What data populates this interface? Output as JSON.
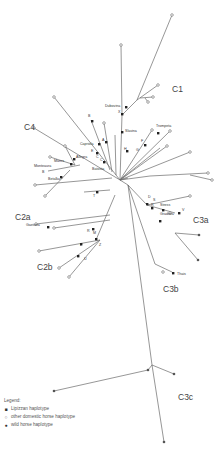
{
  "diagram": {
    "type": "median-joining haplotype network",
    "clades": [
      {
        "id": "C1",
        "x": 172,
        "y": 92
      },
      {
        "id": "C4",
        "x": 24,
        "y": 130
      },
      {
        "id": "C2a",
        "x": 15,
        "y": 220
      },
      {
        "id": "C2b",
        "x": 37,
        "y": 270
      },
      {
        "id": "C3a",
        "x": 193,
        "y": 223
      },
      {
        "id": "C3b",
        "x": 163,
        "y": 292
      },
      {
        "id": "C3c",
        "x": 178,
        "y": 400
      }
    ],
    "node_labels": [
      {
        "text": "Dubovina",
        "x": 105,
        "y": 107
      },
      {
        "text": "X",
        "x": 118,
        "y": 113
      },
      {
        "text": "Slavina",
        "x": 125,
        "y": 132
      },
      {
        "text": "Trompeta",
        "x": 156,
        "y": 127
      },
      {
        "text": "B",
        "x": 88,
        "y": 117
      },
      {
        "text": "Capriola",
        "x": 80,
        "y": 145
      },
      {
        "text": "A",
        "x": 102,
        "y": 141
      },
      {
        "text": "E",
        "x": 91,
        "y": 152
      },
      {
        "text": "C",
        "x": 96,
        "y": 158
      },
      {
        "text": "C",
        "x": 100,
        "y": 161
      },
      {
        "text": "Batosta",
        "x": 92,
        "y": 170
      },
      {
        "text": "H",
        "x": 124,
        "y": 150
      },
      {
        "text": "F",
        "x": 141,
        "y": 142
      },
      {
        "text": "G",
        "x": 136,
        "y": 151
      },
      {
        "text": "Allegra",
        "x": 76,
        "y": 158
      },
      {
        "text": "Manrs",
        "x": 54,
        "y": 162
      },
      {
        "text": "Monteaura",
        "x": 34,
        "y": 167
      },
      {
        "text": "B",
        "x": 42,
        "y": 173
      },
      {
        "text": "Betalka",
        "x": 48,
        "y": 180
      },
      {
        "text": "T",
        "x": 93,
        "y": 197
      },
      {
        "text": "Gaetana",
        "x": 26,
        "y": 226
      },
      {
        "text": "R",
        "x": 87,
        "y": 232
      },
      {
        "text": "M",
        "x": 93,
        "y": 234
      },
      {
        "text": "L",
        "x": 80,
        "y": 246
      },
      {
        "text": "Z",
        "x": 99,
        "y": 246
      },
      {
        "text": "U",
        "x": 84,
        "y": 260
      },
      {
        "text": "D",
        "x": 148,
        "y": 198
      },
      {
        "text": "S",
        "x": 153,
        "y": 201
      },
      {
        "text": "R",
        "x": 151,
        "y": 206
      },
      {
        "text": "Stress",
        "x": 160,
        "y": 206
      },
      {
        "text": "V",
        "x": 182,
        "y": 211
      },
      {
        "text": "Gradova",
        "x": 160,
        "y": 215
      },
      {
        "text": "Thais",
        "x": 177,
        "y": 275
      }
    ]
  },
  "legend": {
    "title": "Legend:",
    "items": [
      {
        "symbol": "■",
        "label": "Lipizzan haplotype",
        "color": "#222222"
      },
      {
        "symbol": "○",
        "label": "other domestic horse haplotype",
        "color": "#666666"
      },
      {
        "symbol": "●",
        "label": "wild horse haplotype",
        "color": "#555555"
      }
    ]
  }
}
